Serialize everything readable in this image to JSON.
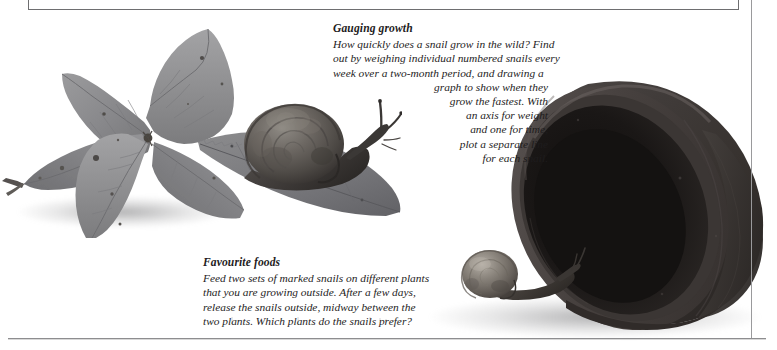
{
  "page": {
    "width": 777,
    "height": 350,
    "background_color": "#ffffff",
    "text_color": "#1e1c1d",
    "rule_color": "#6e6e70"
  },
  "captions": [
    {
      "id": "gauging-growth",
      "heading": "Gauging growth",
      "lines": [
        "How quickly does a snail grow in the wild? Find",
        "out by weighing individual numbered snails every",
        "week over a two-month period, and drawing a",
        "graph to show when they",
        "grow the fastest. With",
        "an axis for weight",
        "and one for time,",
        "plot a separate line",
        "for each snail."
      ],
      "full_text": "How quickly does a snail grow in the wild? Find out by weighing individual numbered snails every week over a two-month period, and drawing a graph to show when they grow the fastest. With an axis for weight and one for time, plot a separate line for each snail."
    },
    {
      "id": "favourite-foods",
      "heading": "Favourite foods",
      "lines": [
        "Feed two sets of marked snails on different plants",
        "that you are growing outside. After a few days,",
        "release the snails outside, midway between the",
        "two plants. Which plants do the snails prefer?"
      ],
      "full_text": "Feed two sets of marked snails on different plants that you are growing outside. After a few days, release the snails outside, midway between the two plants. Which plants do the snails prefer?"
    }
  ],
  "artwork": {
    "bramble_leaf": {
      "name": "bramble-leaf-cluster",
      "color": "#8d8d8f"
    },
    "snail_on_leaf": {
      "name": "garden-snail-on-leaf",
      "shell_color": "#5a5653"
    },
    "flowerpot": {
      "name": "terracotta-flowerpot",
      "color": "#3a3635"
    },
    "snail_on_pot": {
      "name": "garden-snail-on-pot-rim",
      "shell_color": "#6d6a66"
    }
  }
}
